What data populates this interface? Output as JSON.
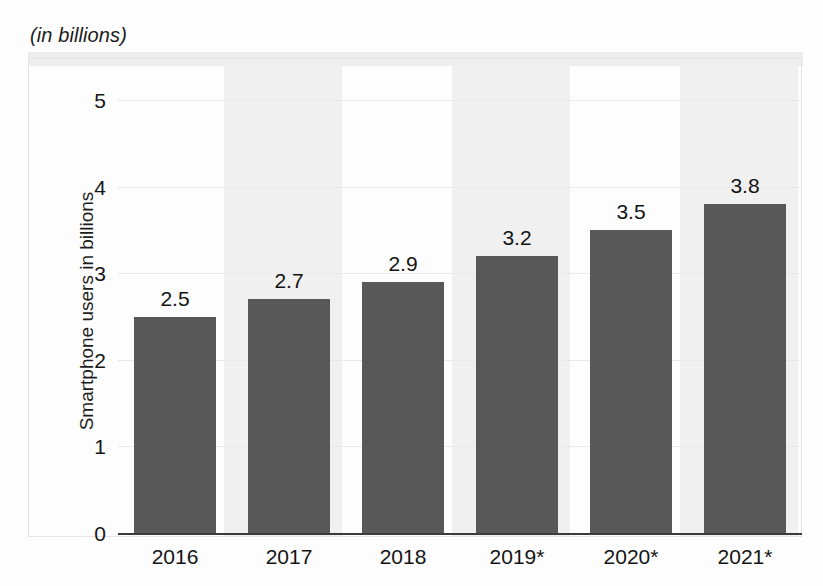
{
  "figure": {
    "title": "(in billions)"
  },
  "chart_data": {
    "type": "bar",
    "title": "(in billions)",
    "xlabel": "",
    "ylabel": "Smartphone users in billions",
    "categories": [
      "2016",
      "2017",
      "2018",
      "2019*",
      "2020*",
      "2021*"
    ],
    "values": [
      2.5,
      2.7,
      2.9,
      3.2,
      3.5,
      3.8
    ],
    "value_labels": [
      "2.5",
      "2.7",
      "2.9",
      "3.2",
      "3.5",
      "3.8"
    ],
    "ylim": [
      0,
      5
    ],
    "yticks": [
      "0",
      "1",
      "2",
      "3",
      "4",
      "5"
    ],
    "ytick_values": [
      0,
      1,
      2,
      3,
      4,
      5
    ],
    "grid": true,
    "legend": "none",
    "bar_color": "#585858",
    "gridline_color": "#e9e9e9",
    "axis_color": "#3b3b3b",
    "text_color": "#141414"
  }
}
